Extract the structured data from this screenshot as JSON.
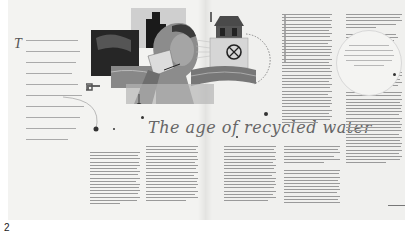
{
  "figure": {
    "label": "2"
  },
  "article": {
    "title": "The age of recycled water",
    "intro": {
      "dropcap": "T",
      "line_count": 10,
      "legible": false
    },
    "illustration": {
      "description": "Collage: man drinking water from a glass, pipes, water tower building with valve wheel, city silhouette, water waves",
      "tone": "grayscale"
    },
    "left_page_columns": [
      {
        "line_count": 17,
        "legible": false
      },
      {
        "line_count": 17,
        "legible": false
      },
      {
        "line_count": 17,
        "legible": false
      }
    ],
    "right_page_columns": [
      {
        "line_count": 50,
        "legible": false
      },
      {
        "line_count": 50,
        "legible": false
      },
      {
        "line_count": 30,
        "legible": false
      }
    ],
    "pull_quote": {
      "line_count": 5,
      "legible": false
    },
    "author_signature": {
      "legible": false
    }
  },
  "colors": {
    "paper": "#f1f1ef",
    "text_gray": "#9a9a9a",
    "title_gray": "#666666"
  }
}
